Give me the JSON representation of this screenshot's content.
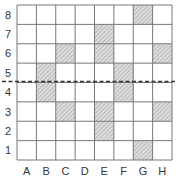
{
  "diagram": {
    "title": "",
    "columns": [
      "A",
      "B",
      "C",
      "D",
      "E",
      "F",
      "G",
      "H"
    ],
    "rows": [
      "8",
      "7",
      "6",
      "5",
      "4",
      "3",
      "2",
      "1"
    ],
    "shaded_cells": [
      {
        "col": "G",
        "row": "8"
      },
      {
        "col": "E",
        "row": "7"
      },
      {
        "col": "C",
        "row": "6"
      },
      {
        "col": "E",
        "row": "6"
      },
      {
        "col": "H",
        "row": "6"
      },
      {
        "col": "B",
        "row": "5"
      },
      {
        "col": "F",
        "row": "5"
      },
      {
        "col": "B",
        "row": "4"
      },
      {
        "col": "F",
        "row": "4"
      },
      {
        "col": "C",
        "row": "3"
      },
      {
        "col": "E",
        "row": "3"
      },
      {
        "col": "H",
        "row": "3"
      },
      {
        "col": "E",
        "row": "2"
      },
      {
        "col": "G",
        "row": "1"
      }
    ],
    "dashed_line": {
      "between_rows": [
        "5",
        "4"
      ],
      "style": "dashed"
    },
    "colors": {
      "grid_line": "#777777",
      "shade_fill": "#d8d8d8",
      "hatch": "#999999",
      "dashed_line": "#333333",
      "label": "#333333"
    }
  }
}
